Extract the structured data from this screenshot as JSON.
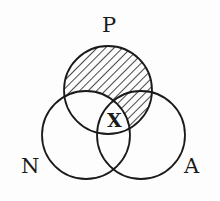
{
  "diagram": {
    "type": "venn",
    "sets": [
      {
        "id": "P",
        "label": "P",
        "cx": 108,
        "cy": 90,
        "r": 44
      },
      {
        "id": "N",
        "label": "N",
        "cx": 86,
        "cy": 135,
        "r": 44
      },
      {
        "id": "A",
        "label": "A",
        "cx": 141,
        "cy": 135,
        "r": 44
      }
    ],
    "shaded_region": "P minus N",
    "marker": {
      "label": "X",
      "region": "P ∩ N ∩ A"
    },
    "colors": {
      "stroke": "#1a1a1a",
      "background": "#fdfdfd"
    }
  }
}
